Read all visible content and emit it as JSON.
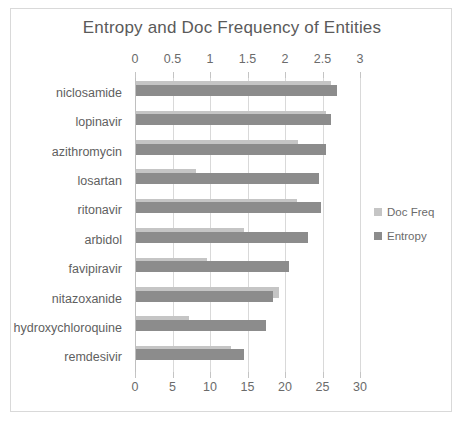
{
  "chart_data": {
    "type": "bar",
    "orientation": "horizontal",
    "title": "Entropy and Doc Frequency of Entities",
    "xlabel": "",
    "ylabel": "",
    "grid": true,
    "legend_position": "right",
    "categories": [
      "niclosamide",
      "lopinavir",
      "azithromycin",
      "losartan",
      "ritonavir",
      "arbidol",
      "favipiravir",
      "nitazoxanide",
      "hydroxychloroquine",
      "remdesivir"
    ],
    "series": [
      {
        "name": "Doc Freq",
        "axis": "bottom",
        "color": "#c5c5c5",
        "values": [
          26.0,
          25.3,
          21.6,
          8.0,
          21.4,
          14.4,
          9.4,
          19.1,
          7.1,
          12.7
        ]
      },
      {
        "name": "Entropy",
        "axis": "top",
        "color": "#8c8c8c",
        "values": [
          2.68,
          2.6,
          2.53,
          2.44,
          2.47,
          2.29,
          2.04,
          1.83,
          1.73,
          1.44
        ]
      }
    ],
    "top_axis": {
      "label": "Entropy",
      "ticks": [
        "0",
        "0.5",
        "1",
        "1.5",
        "2",
        "2.5",
        "3"
      ],
      "min": 0,
      "max": 3
    },
    "bottom_axis": {
      "label": "Doc Freq",
      "ticks": [
        "0",
        "5",
        "10",
        "15",
        "20",
        "25",
        "30"
      ],
      "min": 0,
      "max": 30
    },
    "legend": [
      {
        "label": "Doc Freq",
        "color": "#c5c5c5"
      },
      {
        "label": "Entropy",
        "color": "#8c8c8c"
      }
    ]
  }
}
